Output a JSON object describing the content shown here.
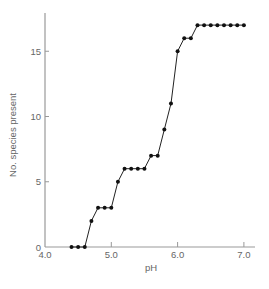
{
  "chart_data": {
    "type": "line",
    "title": "",
    "xlabel": "pH",
    "ylabel": "No. species present",
    "xlim": [
      4.0,
      7.15
    ],
    "ylim": [
      0,
      18
    ],
    "x_ticks": [
      4.0,
      5.0,
      6.0,
      7.0
    ],
    "x_tick_labels": [
      "4.0",
      "5.0",
      "6.0",
      "7.0"
    ],
    "y_ticks": [
      0,
      5,
      10,
      15
    ],
    "y_tick_labels": [
      "0",
      "5",
      "10",
      "15"
    ],
    "grid": false,
    "legend": null,
    "series": [
      {
        "name": "species",
        "marker": "circle",
        "color": "#111111",
        "x": [
          4.4,
          4.5,
          4.6,
          4.7,
          4.8,
          4.9,
          5.0,
          5.1,
          5.2,
          5.3,
          5.4,
          5.5,
          5.6,
          5.7,
          5.8,
          5.9,
          6.0,
          6.1,
          6.2,
          6.3,
          6.4,
          6.5,
          6.6,
          6.7,
          6.8,
          6.9,
          7.0
        ],
        "values": [
          0,
          0,
          0,
          2,
          3,
          3,
          3,
          5,
          6,
          6,
          6,
          6,
          7,
          7,
          9,
          11,
          15,
          16,
          16,
          17,
          17,
          17,
          17,
          17,
          17,
          17,
          17
        ]
      }
    ]
  },
  "colors": {
    "axis": "#999999",
    "line": "#222222",
    "marker": "#111111",
    "text": "#666666"
  }
}
